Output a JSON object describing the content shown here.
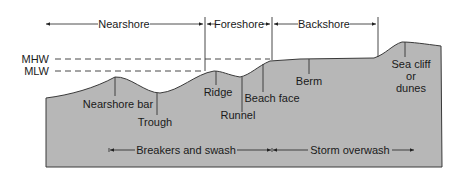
{
  "diagram": {
    "type": "beach-profile-cross-section",
    "colors": {
      "profile_fill": "#b7b7b7",
      "outline": "#3a3a3a",
      "text": "#1a1a1a",
      "background": "#ffffff"
    },
    "zones_top": [
      {
        "label": "Nearshore"
      },
      {
        "label": "Foreshore"
      },
      {
        "label": "Backshore"
      }
    ],
    "water_levels": [
      {
        "label": "MHW"
      },
      {
        "label": "MLW"
      }
    ],
    "features": [
      {
        "label": "Nearshore bar"
      },
      {
        "label": "Trough"
      },
      {
        "label": "Ridge"
      },
      {
        "label": "Runnel"
      },
      {
        "label": "Beach face"
      },
      {
        "label": "Berm"
      },
      {
        "label": "Sea cliff",
        "label2": "or",
        "label3": "dunes"
      }
    ],
    "zones_bottom": [
      {
        "label": "Breakers and swash"
      },
      {
        "label": "Storm overwash"
      }
    ]
  }
}
